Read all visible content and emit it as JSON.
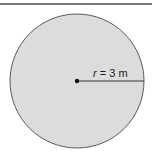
{
  "figure": {
    "label_var": "r",
    "label_rest": " = 3 m",
    "colors": {
      "fill": "#dcdcdc",
      "stroke": "#555555",
      "topline": "#777777"
    }
  }
}
